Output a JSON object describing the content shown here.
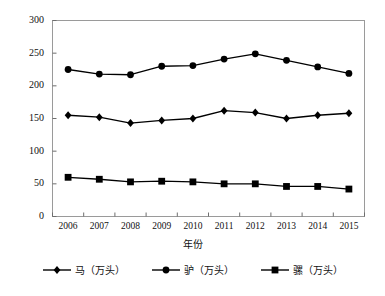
{
  "chart_data": {
    "type": "line",
    "title": "",
    "xlabel": "年份",
    "ylabel": "",
    "categories": [
      "2006",
      "2007",
      "2008",
      "2009",
      "2010",
      "2011",
      "2012",
      "2013",
      "2014",
      "2015"
    ],
    "ylim": [
      0,
      300
    ],
    "ytick_labels": [
      "0",
      "50",
      "100",
      "150",
      "200",
      "250",
      "300"
    ],
    "ytick_values": [
      0,
      50,
      100,
      150,
      200,
      250,
      300
    ],
    "grid": false,
    "legend_position": "bottom",
    "series": [
      {
        "name": "马（万头）",
        "marker": "diamond",
        "color": "#000000",
        "values": [
          155,
          152,
          143,
          147,
          150,
          162,
          159,
          150,
          155,
          158
        ]
      },
      {
        "name": "驴（万头）",
        "marker": "circle",
        "color": "#000000",
        "values": [
          225,
          218,
          217,
          230,
          231,
          241,
          249,
          239,
          229,
          219
        ]
      },
      {
        "name": "骡（万头）",
        "marker": "square",
        "color": "#000000",
        "values": [
          60,
          57,
          53,
          54,
          53,
          50,
          50,
          46,
          46,
          42
        ]
      }
    ]
  }
}
